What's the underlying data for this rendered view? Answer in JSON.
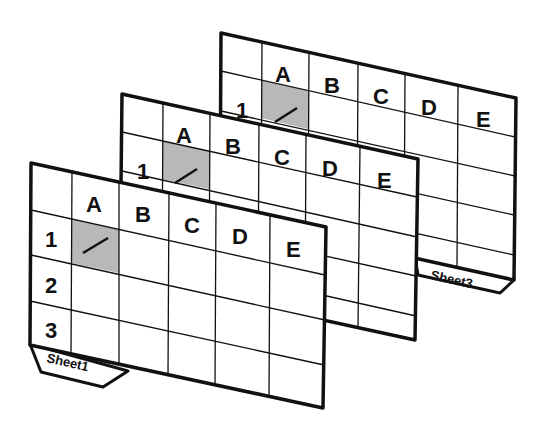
{
  "figure": {
    "colors": {
      "line": "#111111",
      "sheet_fill": "#ffffff",
      "selected_cell": "#b8b8b8"
    },
    "sheets": [
      {
        "name": "Sheet3",
        "tab_label": "Sheet3",
        "columns": [
          "A",
          "B",
          "C",
          "D",
          "E"
        ],
        "rows": [
          "1"
        ],
        "selected_cell": "A1"
      },
      {
        "name": "Sheet2",
        "columns": [
          "A",
          "B",
          "C",
          "D",
          "E"
        ],
        "rows": [
          "1"
        ],
        "selected_cell": "A1"
      },
      {
        "name": "Sheet1",
        "tab_label": "Sheet1",
        "columns": [
          "A",
          "B",
          "C",
          "D",
          "E"
        ],
        "rows": [
          "1",
          "2",
          "3"
        ],
        "selected_cell": "A1"
      }
    ]
  }
}
